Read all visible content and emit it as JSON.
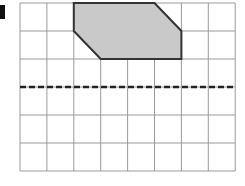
{
  "diagram": {
    "type": "grid-reflection",
    "grid": {
      "columns": 8,
      "rows": 6,
      "origin_x": 20,
      "origin_y": 3,
      "cell_w": 26.9,
      "cell_h": 28,
      "line_color": "#9a9a9a"
    },
    "shape": {
      "name": "shaded-hexagon",
      "vertices_grid": [
        [
          2,
          0
        ],
        [
          5,
          0
        ],
        [
          6,
          1
        ],
        [
          6,
          2
        ],
        [
          3,
          2
        ],
        [
          2,
          1
        ]
      ],
      "fill": "#c9c9c9",
      "stroke": "#333333"
    },
    "mirror_line": {
      "name": "dashed-mirror-line",
      "row": 3,
      "color": "#222222"
    }
  }
}
